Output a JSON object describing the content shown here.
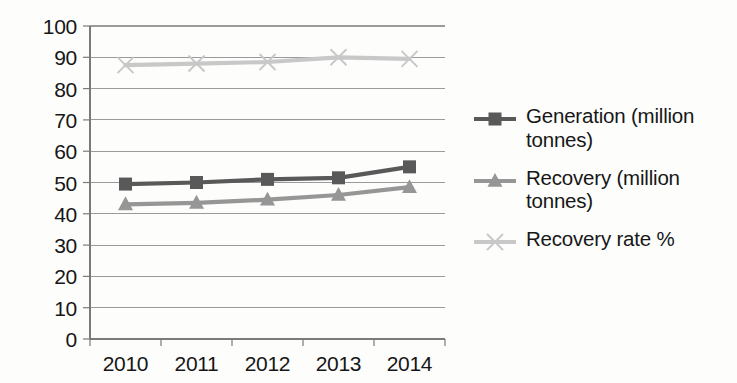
{
  "chart_data": {
    "type": "line",
    "title": "",
    "xlabel": "",
    "ylabel": "",
    "categories": [
      "2010",
      "2011",
      "2012",
      "2013",
      "2014"
    ],
    "ylim": [
      0,
      100
    ],
    "ytick_step": 10,
    "yticks": [
      "100",
      "90",
      "80",
      "70",
      "60",
      "50",
      "40",
      "30",
      "20",
      "10",
      "0"
    ],
    "grid": true,
    "legend_position": "right",
    "series": [
      {
        "name": "Generation (million tonnes)",
        "marker": "square",
        "color": "#595959",
        "values": [
          49.5,
          50,
          51,
          51.5,
          55
        ]
      },
      {
        "name": "Recovery (million tonnes)",
        "marker": "triangle",
        "color": "#969696",
        "values": [
          43,
          43.5,
          44.5,
          46,
          48.5
        ]
      },
      {
        "name": "Recovery rate %",
        "marker": "cross",
        "color": "#c8c8c8",
        "values": [
          87.5,
          88,
          88.5,
          90,
          89.5
        ]
      }
    ]
  },
  "axis": {
    "line_color": "#7a7a7a",
    "grid_color": "#9a9a9a"
  }
}
